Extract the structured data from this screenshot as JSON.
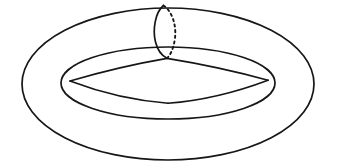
{
  "figure": {
    "kind": "mathematical-line-diagram",
    "canvas": {
      "width": 339,
      "height": 166,
      "background": "#ffffff"
    },
    "stroke": {
      "color": "#161616",
      "width": 1.7,
      "width_thin": 1.5,
      "linecap": "round",
      "linejoin": "round"
    },
    "dash": {
      "pattern": "2.2 3.4",
      "width": 1.9
    },
    "shapes": {
      "outer_ellipse": {
        "name": "outer-boundary-ellipse",
        "cx": 168,
        "cy": 84,
        "rx": 146,
        "ry": 76,
        "style": "solid"
      },
      "inner_ellipse": {
        "name": "inner-hole-ellipse",
        "cx": 168,
        "cy": 83,
        "rx": 107,
        "ry": 36,
        "style": "solid"
      },
      "meridian_front_arc": {
        "name": "meridian-front-arc",
        "style": "solid",
        "path": "M 163.5 5.5 C 155.0 12.5 152.5 30.0 155.5 42.0 C 157.8 51.2 162.5 56.0 167.0 58.2"
      },
      "meridian_back_arc": {
        "name": "meridian-back-arc",
        "style": "dashed",
        "path": "M 163.5 5.5 C 172.5 11.5 176.5 26.0 175.0 38.0 C 173.6 49.0 170.2 55.2 167.0 58.2"
      },
      "quad_top_left_edge": {
        "name": "quadrilateral-top-left-edge",
        "style": "solid",
        "path": "M 167.0 58.4 C 133.0 64.2 101.0 72.0 70.0 81.0"
      },
      "quad_top_right_edge": {
        "name": "quadrilateral-top-right-edge",
        "style": "solid",
        "path": "M 167.0 58.4 C 200.5 63.8 236.0 71.5 268.0 80.2"
      },
      "quad_bottom_left_edge": {
        "name": "quadrilateral-bottom-left-edge",
        "style": "solid",
        "path": "M 70.0 81.0 C 99.0 92.0 133.0 100.5 168.0 103.2"
      },
      "quad_bottom_right_edge": {
        "name": "quadrilateral-bottom-right-edge",
        "style": "solid",
        "path": "M 268.0 80.2 C 238.0 91.5 203.0 100.6 168.0 103.2"
      }
    },
    "vertices": {
      "meridian_top": {
        "name": "meridian-top-point",
        "x": 163.5,
        "y": 5.5
      },
      "quad_top": {
        "name": "quadrilateral-top-vertex",
        "x": 167.0,
        "y": 58.4
      },
      "quad_left": {
        "name": "quadrilateral-left-vertex",
        "x": 70.0,
        "y": 81.0
      },
      "quad_right": {
        "name": "quadrilateral-right-vertex",
        "x": 268.0,
        "y": 80.2
      },
      "quad_bottom": {
        "name": "quadrilateral-bottom-vertex",
        "x": 168.0,
        "y": 103.2
      }
    }
  }
}
